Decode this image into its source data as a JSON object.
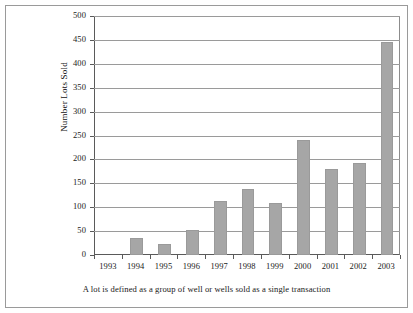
{
  "chart_data": {
    "type": "bar",
    "title": "",
    "xlabel": "",
    "ylabel": "Number Lots Sold",
    "categories": [
      "1993",
      "1994",
      "1995",
      "1996",
      "1997",
      "1998",
      "1999",
      "2000",
      "2001",
      "2002",
      "2003"
    ],
    "values": [
      0,
      35,
      22,
      53,
      112,
      138,
      108,
      240,
      180,
      193,
      445
    ],
    "ylim": [
      0,
      500
    ],
    "ytick_labels": [
      "0",
      "50",
      "100",
      "150",
      "200",
      "250",
      "300",
      "350",
      "400",
      "450",
      "500"
    ],
    "ytick_values": [
      0,
      50,
      100,
      150,
      200,
      250,
      300,
      350,
      400,
      450,
      500
    ],
    "grid": true,
    "legend": "none",
    "series_color": "#a6a6a6"
  },
  "caption": "A lot is defined as a group of well or wells sold as a single transaction"
}
